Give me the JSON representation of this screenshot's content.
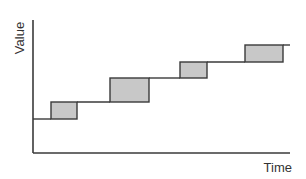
{
  "chart_data": {
    "type": "diagram",
    "title": "",
    "xlabel": "Time",
    "ylabel": "Value",
    "grid": false,
    "colors": {
      "line": "#3a3a3a",
      "box_fill": "#c8c8c8",
      "background": "#ffffff"
    },
    "steps": [
      {
        "x_start": 33,
        "x_end": 51,
        "level_y": 119
      },
      {
        "x_start": 77,
        "x_end": 110,
        "level_y": 102
      },
      {
        "x_start": 149,
        "x_end": 180,
        "level_y": 78
      },
      {
        "x_start": 207,
        "x_end": 245,
        "level_y": 62
      },
      {
        "x_start": 283,
        "x_end": 290,
        "level_y": 45
      }
    ],
    "boxes": [
      {
        "x": 51,
        "y": 102,
        "width": 26,
        "height": 17
      },
      {
        "x": 110,
        "y": 78,
        "width": 39,
        "height": 24
      },
      {
        "x": 180,
        "y": 62,
        "width": 27,
        "height": 16
      },
      {
        "x": 245,
        "y": 45,
        "width": 38,
        "height": 17
      }
    ]
  },
  "labels": {
    "y_axis": "Value",
    "x_axis": "Time"
  }
}
